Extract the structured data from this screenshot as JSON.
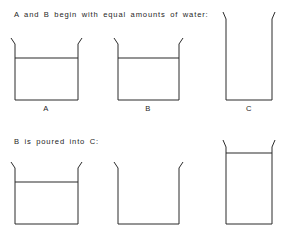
{
  "figure": {
    "type": "diagram",
    "background_color": "#ffffff",
    "line_color": "#2b2b2b",
    "width": 284,
    "height": 237
  },
  "rows": [
    {
      "id": "row-initial",
      "caption": "A and B begin with equal amounts of water:",
      "caption_x": 14,
      "caption_y": 10,
      "labels_y": 104,
      "vessels": [
        {
          "id": "vessel-a-initial",
          "label": "A",
          "shape": "wide",
          "x": 15,
          "y": 44,
          "width": 63,
          "height": 56,
          "rim_flare": 4,
          "rim_lip": 6,
          "filled": true,
          "water_level_y": 58,
          "label_center_x": 46
        },
        {
          "id": "vessel-b-initial",
          "label": "B",
          "shape": "wide",
          "x": 118,
          "y": 44,
          "width": 61,
          "height": 56,
          "rim_flare": 4,
          "rim_lip": 6,
          "filled": true,
          "water_level_y": 58,
          "label_center_x": 148
        },
        {
          "id": "vessel-c-initial",
          "label": "C",
          "shape": "tall",
          "x": 226,
          "y": 19,
          "width": 46,
          "height": 81,
          "rim_flare": 3,
          "rim_lip": 7,
          "filled": false,
          "water_level_y": null,
          "label_center_x": 249
        }
      ]
    },
    {
      "id": "row-poured",
      "caption": "B is poured into C:",
      "caption_x": 14,
      "caption_y": 137,
      "labels_y": null,
      "vessels": [
        {
          "id": "vessel-a-poured",
          "label": "",
          "shape": "wide",
          "x": 15,
          "y": 168,
          "width": 63,
          "height": 56,
          "rim_flare": 4,
          "rim_lip": 6,
          "filled": true,
          "water_level_y": 182,
          "label_center_x": 46
        },
        {
          "id": "vessel-b-poured",
          "label": "",
          "shape": "wide",
          "x": 118,
          "y": 168,
          "width": 61,
          "height": 56,
          "rim_flare": 4,
          "rim_lip": 6,
          "filled": false,
          "water_level_y": null,
          "label_center_x": 148
        },
        {
          "id": "vessel-c-poured",
          "label": "",
          "shape": "tall",
          "x": 226,
          "y": 147,
          "width": 46,
          "height": 77,
          "rim_flare": 3,
          "rim_lip": 7,
          "filled": true,
          "water_level_y": 153,
          "label_center_x": 249
        }
      ]
    }
  ]
}
